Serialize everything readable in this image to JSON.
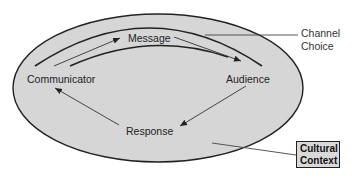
{
  "diagram": {
    "type": "communication-process-model",
    "nodes": {
      "communicator": "Communicator",
      "message": "Message",
      "audience": "Audience",
      "response": "Response"
    },
    "flows": [
      {
        "from": "Communicator",
        "to": "Message"
      },
      {
        "from": "Message",
        "to": "Audience"
      },
      {
        "from": "Audience",
        "to": "Response"
      },
      {
        "from": "Response",
        "to": "Communicator"
      }
    ],
    "callouts": {
      "channel_choice_line1": "Channel",
      "channel_choice_line2": "Choice",
      "cultural_context_line1": "Cultural",
      "cultural_context_line2": "Context"
    },
    "colors": {
      "ellipse_fill": "#d6d6d6",
      "stroke": "#222222",
      "callout_box_fill": "#d9d9d9"
    }
  }
}
